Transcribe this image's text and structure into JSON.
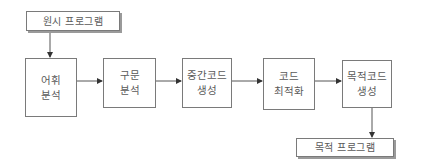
{
  "diagram": {
    "source": {
      "label": "원시 프로그램"
    },
    "target": {
      "label": "목적 프로그램"
    },
    "stages": [
      {
        "line1": "어휘",
        "line2": "분석"
      },
      {
        "line1": "구문",
        "line2": "분석"
      },
      {
        "line1": "중간코드",
        "line2": "생성"
      },
      {
        "line1": "코드",
        "line2": "최적화"
      },
      {
        "line1": "목적코드",
        "line2": "생성"
      }
    ],
    "colors": {
      "line": "#555555",
      "border": "#7a7a7a",
      "text": "#5a5a5a",
      "shadow": "#9a9a9a"
    }
  }
}
